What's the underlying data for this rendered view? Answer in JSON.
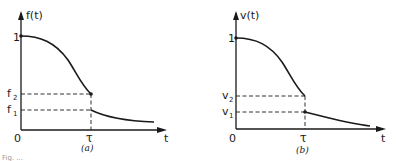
{
  "panels": [
    {
      "id": "a",
      "caption": "(a)",
      "ylabel": "f(t)",
      "xlabel": "t",
      "origin_label": "0",
      "y_ticks": {
        "one": "1",
        "upper": "f",
        "upper_sub": "2",
        "lower": "f",
        "lower_sub": "1"
      },
      "x_tick": "τ",
      "curve_description": "Starts at 1 at t=0, decreases smoothly to f2 at t=τ, jumps down to f1, then decays toward 0"
    },
    {
      "id": "b",
      "caption": "(b)",
      "ylabel": "v(t)",
      "xlabel": "t",
      "origin_label": "0",
      "y_ticks": {
        "one": "1",
        "upper": "v",
        "upper_sub": "2",
        "lower": "v",
        "lower_sub": "1"
      },
      "x_tick": "τ",
      "curve_description": "Starts at 1 at t=0, decreases smoothly to v2 at t=τ, jumps down to v1, then decays toward 0"
    }
  ],
  "figure_caption_fragment": "Fig. ..."
}
